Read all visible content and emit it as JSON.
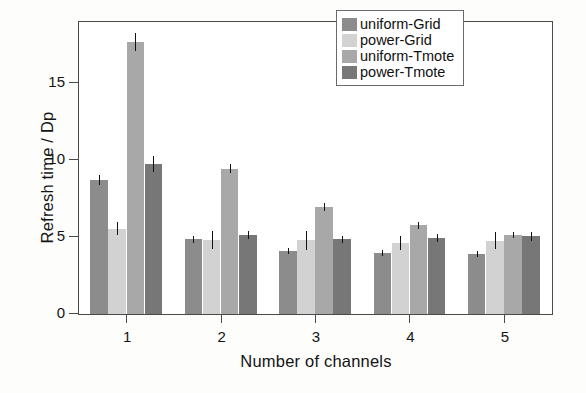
{
  "chart_data": {
    "type": "bar",
    "title": "",
    "xlabel": "Number of channels",
    "ylabel": "Refresh time / Dp",
    "categories": [
      "1",
      "2",
      "3",
      "4",
      "5"
    ],
    "xtick_labels": [
      "1",
      "2",
      "3",
      "4",
      "5"
    ],
    "ytick_labels": [
      "0",
      "5",
      "10",
      "15"
    ],
    "ytick_values": [
      0,
      5,
      10,
      15
    ],
    "ylim": [
      0,
      18.9
    ],
    "xlim_note": "categorical, 5 groups of 4 grouped bars",
    "grid": false,
    "legend_position": "top-right",
    "series": [
      {
        "name": "uniform-Grid",
        "color": "#8c8c8c",
        "values": [
          8.7,
          4.85,
          4.1,
          3.95,
          3.9
        ],
        "errors": [
          0.32,
          0.22,
          0.2,
          0.18,
          0.22
        ]
      },
      {
        "name": "power-Grid",
        "color": "#d2d2d2",
        "values": [
          5.55,
          4.8,
          4.8,
          4.6,
          4.75
        ],
        "errors": [
          0.42,
          0.6,
          0.62,
          0.45,
          0.55
        ]
      },
      {
        "name": "uniform-Tmote",
        "color": "#a8a8a8",
        "values": [
          17.65,
          9.45,
          6.95,
          5.75,
          5.15
        ],
        "errors": [
          0.6,
          0.28,
          0.25,
          0.22,
          0.2
        ]
      },
      {
        "name": "power-Tmote",
        "color": "#777777",
        "values": [
          9.75,
          5.15,
          4.85,
          4.95,
          5.05
        ],
        "errors": [
          0.5,
          0.25,
          0.25,
          0.28,
          0.3
        ]
      }
    ]
  },
  "legend": {
    "items": [
      {
        "label": "uniform-Grid",
        "color": "#8c8c8c"
      },
      {
        "label": "power-Grid",
        "color": "#d2d2d2"
      },
      {
        "label": "uniform-Tmote",
        "color": "#a8a8a8"
      },
      {
        "label": "power-Tmote",
        "color": "#777777"
      }
    ]
  },
  "axes": {
    "y_title": "Refresh time / Dp",
    "x_title": "Number of channels"
  }
}
